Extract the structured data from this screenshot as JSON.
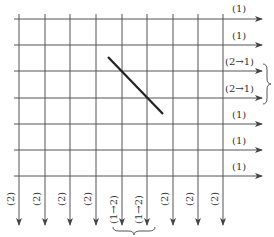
{
  "diagram": {
    "row_labels": [
      "(1)",
      "(1)",
      "(2→1)",
      "(2→1)",
      "(1)",
      "(1)",
      "(1)"
    ],
    "column_labels": [
      "(2)",
      "(2)",
      "(2)",
      "(2)",
      "(1→2)",
      "(1→2)",
      "(2)",
      "(2)",
      "(2)"
    ],
    "colors": {
      "line": "#555555",
      "diagonal": "#222222"
    }
  }
}
